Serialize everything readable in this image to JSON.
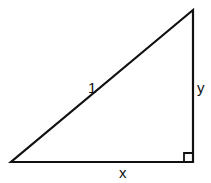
{
  "diagram": {
    "type": "right-triangle",
    "stroke_color": "#111111",
    "background": "#ffffff",
    "vertices": {
      "bottom_left": [
        11,
        162
      ],
      "bottom_right": [
        193,
        162
      ],
      "top_right": [
        193,
        10
      ]
    },
    "right_angle_marker": {
      "corner": "bottom_right",
      "size": 9
    },
    "labels": {
      "hypotenuse": "1",
      "vertical_leg": "y",
      "horizontal_leg": "x"
    }
  }
}
